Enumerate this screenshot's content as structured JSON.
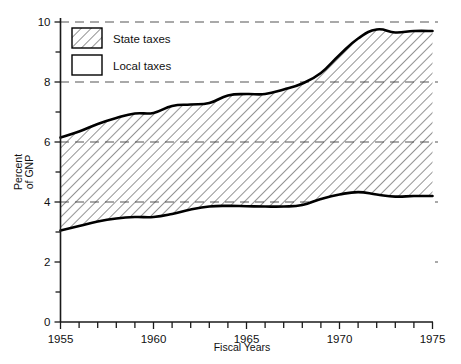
{
  "chart_data": {
    "type": "area",
    "title": "",
    "xlabel": "Fiscal Years",
    "ylabel": "Percent of GNP",
    "ylabel_line1": "Percent",
    "ylabel_line2": "of GNP",
    "xlim": [
      1955,
      1975
    ],
    "ylim": [
      0,
      10
    ],
    "grid": true,
    "grid_values": [
      2,
      4,
      6,
      8,
      10
    ],
    "legend_position": "top-left",
    "stacked": true,
    "x": [
      1955,
      1956,
      1957,
      1958,
      1959,
      1960,
      1961,
      1962,
      1963,
      1964,
      1965,
      1966,
      1967,
      1968,
      1969,
      1970,
      1971,
      1972,
      1973,
      1974,
      1975
    ],
    "series": [
      {
        "name": "Local taxes",
        "key": "local",
        "fill": "white",
        "values": [
          3.05,
          3.2,
          3.35,
          3.45,
          3.5,
          3.5,
          3.6,
          3.75,
          3.85,
          3.87,
          3.86,
          3.85,
          3.85,
          3.9,
          4.1,
          4.25,
          4.33,
          4.25,
          4.18,
          4.2,
          4.2
        ]
      },
      {
        "name": "Total state and local taxes",
        "key": "total",
        "fill": "hatched",
        "values": [
          6.15,
          6.35,
          6.6,
          6.8,
          6.95,
          6.97,
          7.2,
          7.25,
          7.3,
          7.55,
          7.6,
          7.6,
          7.75,
          7.95,
          8.3,
          8.9,
          9.45,
          9.75,
          9.65,
          9.7,
          9.7
        ]
      }
    ],
    "bands": [
      {
        "name": "State taxes",
        "fill": "hatched",
        "description": "Area between local taxes line and total line"
      },
      {
        "name": "Local taxes",
        "fill": "white",
        "description": "Area between zero and local taxes line"
      }
    ],
    "y_ticks_labeled": [
      {
        "value": 10,
        "label": "10"
      },
      {
        "value": 8,
        "label": "8"
      },
      {
        "value": 6,
        "label": "6"
      },
      {
        "value": 4,
        "label": "4"
      },
      {
        "value": 2,
        "label": "2"
      },
      {
        "value": 0,
        "label": "0"
      }
    ],
    "y_ticks_minor": [
      1,
      3,
      5,
      7,
      9
    ],
    "x_ticks_labeled": [
      {
        "value": 1955,
        "label": "1955"
      },
      {
        "value": 1960,
        "label": "1960"
      },
      {
        "value": 1965,
        "label": "1965"
      },
      {
        "value": 1970,
        "label": "1970"
      },
      {
        "value": 1975,
        "label": "1975"
      }
    ],
    "x_ticks_minor": [
      1956,
      1957,
      1958,
      1959,
      1961,
      1962,
      1963,
      1964,
      1966,
      1967,
      1968,
      1969,
      1971,
      1972,
      1973,
      1974
    ]
  },
  "legend": {
    "entries": [
      {
        "label": "State taxes",
        "swatch": "hatched"
      },
      {
        "label": "Local taxes",
        "swatch": "white"
      }
    ]
  },
  "colors": {
    "ink": "#000000",
    "grid": "#555555",
    "background": "#ffffff",
    "hatch": "#444444"
  }
}
